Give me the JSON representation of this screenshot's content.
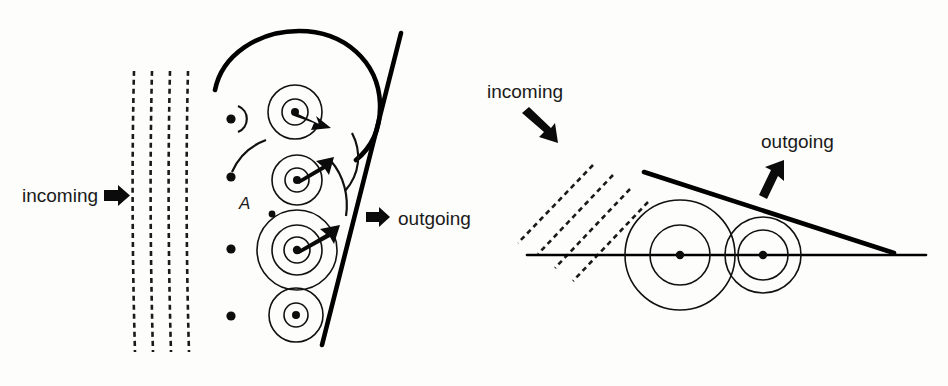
{
  "figure": {
    "background_color": "#fdfdfb",
    "ink_color": "#111111",
    "panels": [
      {
        "id": "left-panel",
        "name": "huygens-normal-incidence",
        "labels": {
          "incoming": "incoming",
          "outgoing": "outgoing",
          "point_a": "A"
        },
        "wavefronts": {
          "type": "dashed-vertical-lines",
          "count": 4,
          "x_positions": [
            133,
            151,
            169,
            187
          ],
          "y_top": 70,
          "y_bottom": 352
        },
        "sources": {
          "comment": "secondary-wavelet source points along the refracting boundary",
          "points": [
            {
              "cx": 231,
              "cy": 119,
              "r": 4.6
            },
            {
              "cx": 231,
              "cy": 177,
              "r": 4.6
            },
            {
              "cx": 231,
              "cy": 249,
              "r": 4.6
            },
            {
              "cx": 231,
              "cy": 316,
              "r": 4.6
            }
          ]
        },
        "wavelets": [
          {
            "cx": 295,
            "cy": 112,
            "radii": [
              13,
              27
            ]
          },
          {
            "cx": 297,
            "cy": 180,
            "radii": [
              12,
              25
            ]
          },
          {
            "cx": 297,
            "cy": 250,
            "radii": [
              13,
              25,
              40
            ]
          },
          {
            "cx": 296,
            "cy": 315,
            "radii": [
              12,
              27
            ]
          }
        ],
        "boundary_line": {
          "x1": 400,
          "y1": 33,
          "x2": 322,
          "y2": 345
        },
        "envelope_arcs": 3,
        "radius_arrows": 3
      },
      {
        "id": "right-panel",
        "name": "huygens-oblique-incidence",
        "labels": {
          "incoming": "incoming",
          "outgoing": "outgoing"
        },
        "wavefronts": {
          "type": "dashed-diagonal-lines",
          "count": 4,
          "angle_deg": 45
        },
        "baseline": {
          "x1": 528,
          "y1": 255,
          "x2": 925,
          "y2": 255
        },
        "wavelets": [
          {
            "cx": 680,
            "cy": 255,
            "radii": [
              30,
              55
            ]
          },
          {
            "cx": 763,
            "cy": 255,
            "radii": [
              25,
              38
            ]
          }
        ],
        "centers": [
          {
            "cx": 680,
            "cy": 255,
            "r": 4.2
          },
          {
            "cx": 763,
            "cy": 255,
            "r": 4.2
          }
        ],
        "tangent_line": {
          "x1": 644,
          "y1": 172,
          "x2": 892,
          "y2": 252
        }
      }
    ]
  }
}
